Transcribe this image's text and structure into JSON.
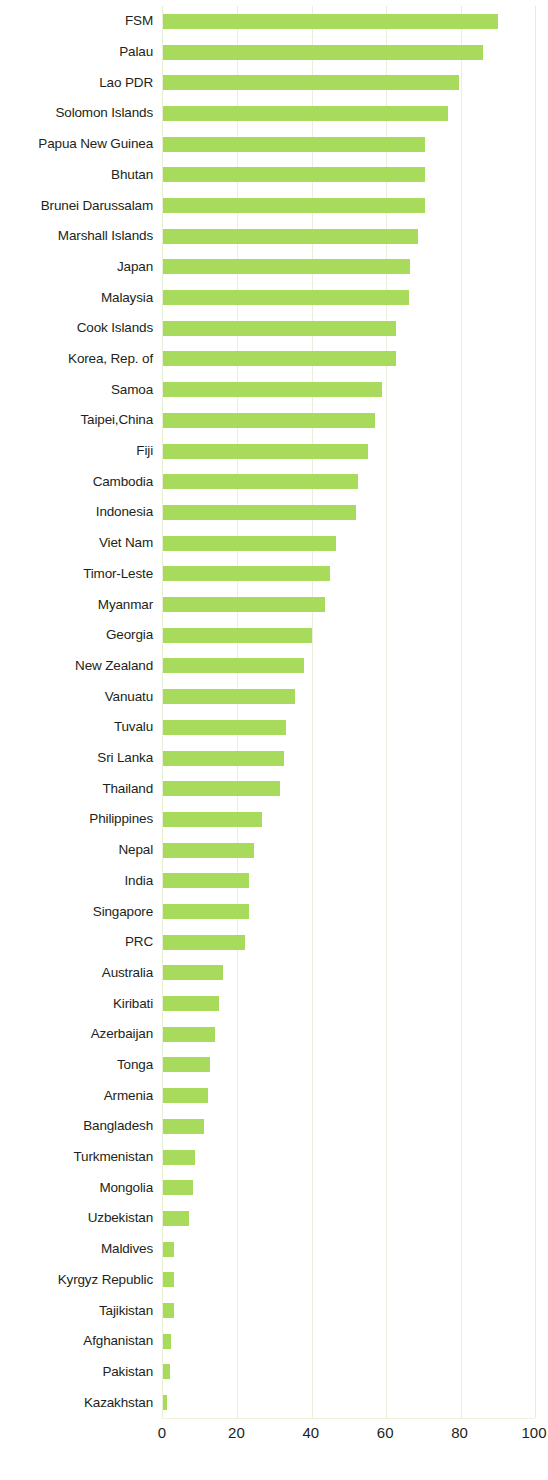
{
  "chart_data": {
    "type": "bar",
    "orientation": "horizontal",
    "title": "",
    "subtitle": "",
    "xlabel": "",
    "ylabel": "",
    "xlim": [
      0,
      100
    ],
    "xticks": [
      0,
      20,
      40,
      60,
      80,
      100
    ],
    "xtick_labels": [
      "0",
      "20",
      "40",
      "60",
      "80",
      "100"
    ],
    "grid": true,
    "grid_axis": "x",
    "legend": null,
    "bar_color": "#a8db5c",
    "text_color": "#231f20",
    "grid_color": "#eceedd",
    "background": "#ffffff",
    "categories": [
      "FSM",
      "Palau",
      "Lao PDR",
      "Solomon Islands",
      "Papua New Guinea",
      "Bhutan",
      "Brunei Darussalam",
      "Marshall Islands",
      "Japan",
      "Malaysia",
      "Cook Islands",
      "Korea, Rep. of",
      "Samoa",
      "Taipei,China",
      "Fiji",
      "Cambodia",
      "Indonesia",
      "Viet Nam",
      "Timor-Leste",
      "Myanmar",
      "Georgia",
      "New Zealand",
      "Vanuatu",
      "Tuvalu",
      "Sri Lanka",
      "Thailand",
      "Philippines",
      "Nepal",
      "India",
      "Singapore",
      "PRC",
      "Australia",
      "Kiribati",
      "Azerbaijan",
      "Tonga",
      "Armenia",
      "Bangladesh",
      "Turkmenistan",
      "Mongolia",
      "Uzbekistan",
      "Maldives",
      "Kyrgyz Republic",
      "Tajikistan",
      "Afghanistan",
      "Pakistan",
      "Kazakhstan"
    ],
    "values": [
      90.0,
      86.0,
      79.5,
      76.5,
      70.5,
      70.5,
      70.3,
      68.5,
      66.5,
      66.0,
      62.5,
      62.5,
      59.0,
      57.0,
      55.0,
      52.5,
      52.0,
      46.5,
      45.0,
      43.5,
      40.0,
      38.0,
      35.5,
      33.0,
      32.5,
      31.5,
      26.5,
      24.5,
      23.0,
      23.0,
      22.0,
      16.0,
      15.0,
      14.0,
      12.5,
      12.0,
      11.0,
      8.5,
      8.0,
      7.0,
      3.0,
      3.0,
      3.0,
      2.2,
      2.0,
      1.2
    ]
  }
}
